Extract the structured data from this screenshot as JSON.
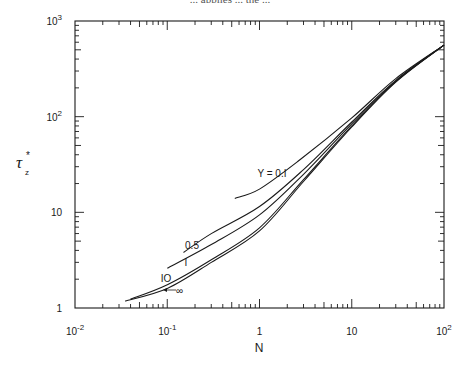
{
  "page": {
    "cropped_header_text": "... applies ... the ..."
  },
  "chart_data": {
    "type": "line",
    "title": "",
    "xlabel": "N",
    "ylabel": "τ_z*",
    "xscale": "log",
    "yscale": "log",
    "xlim": [
      0.01,
      100
    ],
    "ylim": [
      1,
      1000
    ],
    "grid": false,
    "legend": "inline curve labels",
    "x_tick_labels": [
      "10^-2",
      "10^-1",
      "1",
      "10",
      "10^2"
    ],
    "y_tick_labels": [
      "1",
      "10",
      "10^2",
      "10^3"
    ],
    "series": [
      {
        "name": "Y = 0.1",
        "label": "Y = 0.I",
        "points": [
          [
            0.54,
            14
          ],
          [
            1,
            17.5
          ],
          [
            2.7,
            35
          ],
          [
            10,
            97
          ],
          [
            30,
            250
          ],
          [
            100,
            560
          ]
        ]
      },
      {
        "name": "Y = 0.5",
        "label": "0.5",
        "points": [
          [
            0.15,
            3.8
          ],
          [
            0.3,
            6
          ],
          [
            1,
            11.5
          ],
          [
            3,
            28
          ],
          [
            10,
            88
          ],
          [
            30,
            240
          ],
          [
            100,
            560
          ]
        ]
      },
      {
        "name": "Y = 1",
        "label": "I",
        "points": [
          [
            0.1,
            2.6
          ],
          [
            0.3,
            4.6
          ],
          [
            1,
            9.4
          ],
          [
            3,
            25
          ],
          [
            10,
            84
          ],
          [
            30,
            235
          ],
          [
            100,
            560
          ]
        ]
      },
      {
        "name": "Y = 10",
        "label": "IO",
        "points": [
          [
            0.04,
            1.24
          ],
          [
            0.1,
            1.75
          ],
          [
            0.3,
            3.2
          ],
          [
            1,
            6.9
          ],
          [
            3,
            22
          ],
          [
            10,
            80
          ],
          [
            30,
            232
          ],
          [
            100,
            560
          ]
        ]
      },
      {
        "name": "Y = ∞",
        "label": "∞",
        "points": [
          [
            0.035,
            1.18
          ],
          [
            0.1,
            1.6
          ],
          [
            0.3,
            3.0
          ],
          [
            1,
            6.4
          ],
          [
            3,
            21
          ],
          [
            10,
            78
          ],
          [
            30,
            230
          ],
          [
            100,
            560
          ]
        ]
      }
    ]
  },
  "plot_box": {
    "left": 75,
    "right": 444,
    "top": 21,
    "bottom": 308
  },
  "colors": {
    "line": "#1a1a1a",
    "background": "#ffffff"
  }
}
